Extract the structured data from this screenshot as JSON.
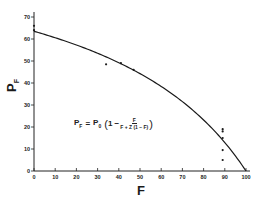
{
  "chart_data": {
    "type": "scatter",
    "title": "",
    "xlabel": "F",
    "ylabel": "P_F",
    "xlim": [
      0,
      100
    ],
    "ylim": [
      0,
      70
    ],
    "x_ticks": [
      0,
      10,
      20,
      30,
      40,
      50,
      60,
      70,
      80,
      90,
      100
    ],
    "y_ticks": [
      0,
      10,
      20,
      30,
      40,
      50,
      60,
      70
    ],
    "grid": false,
    "legend": null,
    "series": [
      {
        "name": "observed",
        "kind": "scatter",
        "points": [
          {
            "x": 0,
            "y": 66
          },
          {
            "x": 0,
            "y": 64
          },
          {
            "x": 34,
            "y": 48.5
          },
          {
            "x": 41,
            "y": 49
          },
          {
            "x": 47,
            "y": 46
          },
          {
            "x": 89,
            "y": 19
          },
          {
            "x": 89,
            "y": 18
          },
          {
            "x": 89,
            "y": 15
          },
          {
            "x": 89,
            "y": 9.5
          },
          {
            "x": 89,
            "y": 5
          }
        ]
      },
      {
        "name": "fitted curve",
        "kind": "line",
        "P0": 63.5,
        "Z": 2.3,
        "x": [
          0,
          10,
          20,
          30,
          40,
          50,
          60,
          70,
          80,
          90,
          100
        ],
        "y": [
          63.5,
          60.9,
          57.9,
          54.1,
          49.7,
          44.3,
          37.6,
          29.5,
          19.7,
          12.9,
          0
        ]
      }
    ],
    "annotations": [
      {
        "text": "P_F = P_0 (1 − F / (F + Z(1 − F)))",
        "x": 20,
        "y": 22
      }
    ]
  },
  "axes": {
    "x_label": "F",
    "y_label_main": "P",
    "y_label_sub": "F",
    "x_tick_labels": [
      "0",
      "10",
      "20",
      "30",
      "40",
      "50",
      "60",
      "70",
      "80",
      "90",
      "100"
    ],
    "y_tick_labels": [
      "0",
      "10",
      "20",
      "30",
      "40",
      "50",
      "60",
      "70"
    ]
  },
  "formula": {
    "lhs_main": "P",
    "lhs_sub": "F",
    "equals": "=",
    "rhs_main": "P",
    "rhs_sub": "0",
    "open_paren": "(",
    "one_minus": "1 −",
    "numerator": "F",
    "denominator": "F + Z (1 − F)",
    "close_paren": ")"
  }
}
